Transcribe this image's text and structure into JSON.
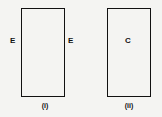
{
  "figures": [
    {
      "caption": "(i)",
      "left_label": "E",
      "right_label": "E"
    },
    {
      "caption": "(ii)",
      "center_label": "C"
    }
  ]
}
